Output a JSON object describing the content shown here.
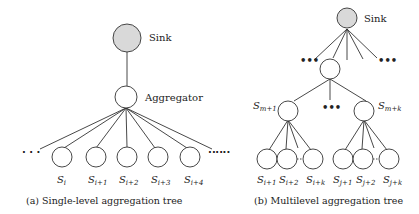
{
  "left_tree": {
    "sink_label": "Sink",
    "aggregator_label": "Aggregator",
    "ellipsis": "· · ·",
    "leaves": [
      {
        "base": "S",
        "sub": "i"
      },
      {
        "base": "S",
        "sub": "i+1"
      },
      {
        "base": "S",
        "sub": "i+2"
      },
      {
        "base": "S",
        "sub": "i+3"
      },
      {
        "base": "S",
        "sub": "i+4"
      }
    ],
    "caption": "(a) Single-level aggregation tree"
  },
  "right_tree": {
    "sink_label": "Sink",
    "ellipsis": "•••",
    "mid_nodes": [
      {
        "base": "S",
        "sub": "m+1"
      },
      {
        "base": "S",
        "sub": "m+k"
      }
    ],
    "group1_leaves": [
      {
        "base": "S",
        "sub": "i+1"
      },
      {
        "base": "S",
        "sub": "i+2"
      },
      {
        "base": "S",
        "sub": "i+k"
      }
    ],
    "group2_leaves": [
      {
        "base": "S",
        "sub": "j+1"
      },
      {
        "base": "S",
        "sub": "j+2"
      },
      {
        "base": "S",
        "sub": "j+k"
      }
    ],
    "caption": "(b) Multilevel aggregation tree"
  },
  "colors": {
    "sink_fill": "#d9d9d9",
    "node_fill": "#ffffff",
    "stroke": "#333333"
  }
}
